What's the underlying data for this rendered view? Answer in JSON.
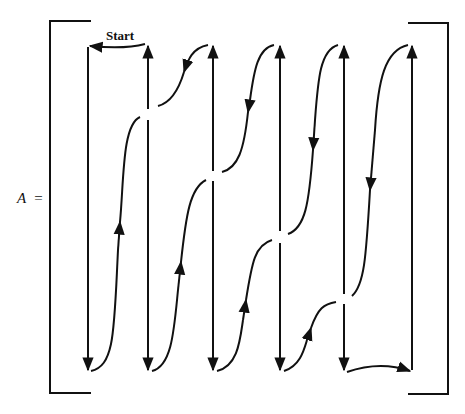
{
  "diagram": {
    "matrix_label": "A",
    "equals": "=",
    "start_label": "Start",
    "columns": 6,
    "stroke_color": "#111111",
    "background": "#ffffff"
  }
}
